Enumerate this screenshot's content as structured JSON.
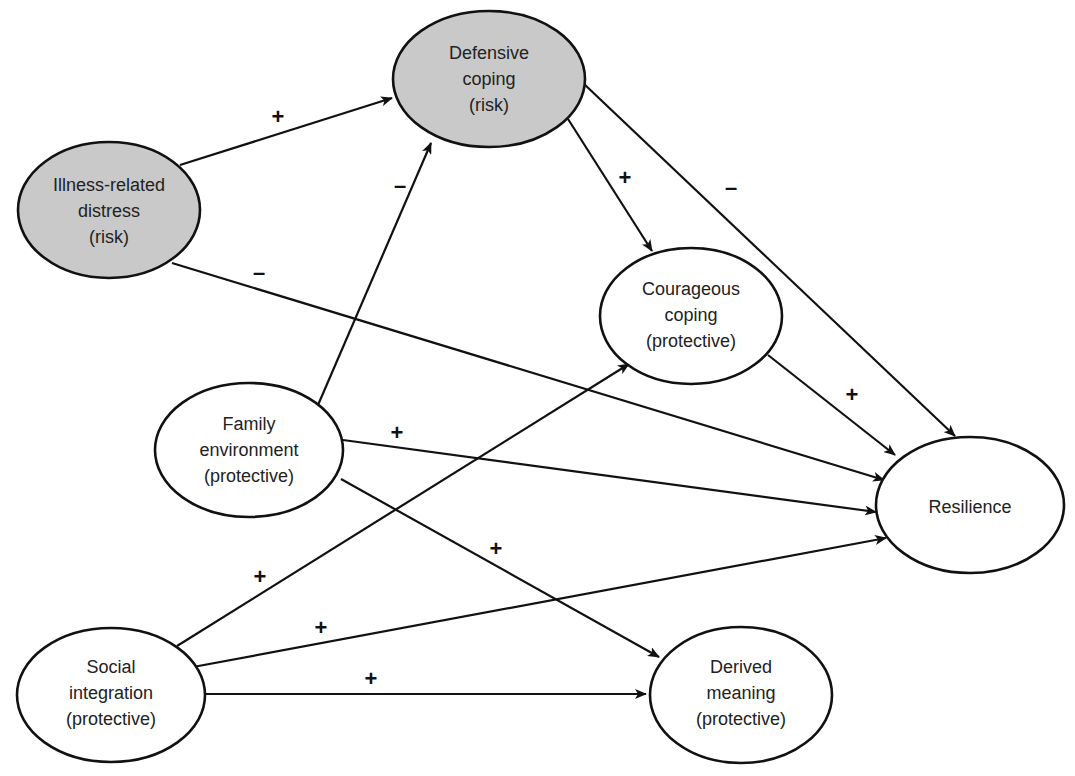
{
  "diagram": {
    "type": "path-model",
    "nodes": [
      {
        "id": "illness",
        "lines": [
          "Illness-related",
          "distress",
          "(risk)"
        ],
        "category": "risk",
        "cx": 109,
        "cy": 210,
        "rx": 91,
        "ry": 68
      },
      {
        "id": "defensive",
        "lines": [
          "Defensive",
          "coping",
          "(risk)"
        ],
        "category": "risk",
        "cx": 489,
        "cy": 79,
        "rx": 96,
        "ry": 68
      },
      {
        "id": "courageous",
        "lines": [
          "Courageous",
          "coping",
          "(protective)"
        ],
        "category": "protective",
        "cx": 691,
        "cy": 316,
        "rx": 91,
        "ry": 68
      },
      {
        "id": "family",
        "lines": [
          "Family",
          "environment",
          "(protective)"
        ],
        "category": "protective",
        "cx": 249,
        "cy": 450,
        "rx": 94,
        "ry": 67
      },
      {
        "id": "resilience",
        "lines": [
          "Resilience"
        ],
        "category": "outcome",
        "cx": 970,
        "cy": 505,
        "rx": 94,
        "ry": 68
      },
      {
        "id": "social",
        "lines": [
          "Social",
          "integration",
          "(protective)"
        ],
        "category": "protective",
        "cx": 111,
        "cy": 695,
        "rx": 94,
        "ry": 67
      },
      {
        "id": "derived",
        "lines": [
          "Derived",
          "meaning",
          "(protective)"
        ],
        "category": "protective",
        "cx": 741,
        "cy": 695,
        "rx": 91,
        "ry": 68
      }
    ],
    "edges": [
      {
        "from": "illness",
        "to": "defensive",
        "sign": "+",
        "x1": 180,
        "y1": 165,
        "x2": 392,
        "y2": 98,
        "lx": 278,
        "ly": 124
      },
      {
        "from": "illness",
        "to": "resilience",
        "sign": "–",
        "x1": 172,
        "y1": 263,
        "x2": 884,
        "y2": 480,
        "lx": 259,
        "ly": 280
      },
      {
        "from": "family",
        "to": "defensive",
        "sign": "–",
        "x1": 315,
        "y1": 412,
        "x2": 431,
        "y2": 143,
        "lx": 400,
        "ly": 193
      },
      {
        "from": "defensive",
        "to": "courageous",
        "sign": "+",
        "x1": 568,
        "y1": 119,
        "x2": 652,
        "y2": 251,
        "lx": 625,
        "ly": 180
      },
      {
        "from": "defensive",
        "to": "resilience",
        "sign": "–",
        "x1": 583,
        "y1": 83,
        "x2": 955,
        "y2": 436,
        "lx": 731,
        "ly": 192
      },
      {
        "from": "courageous",
        "to": "resilience",
        "sign": "+",
        "x1": 768,
        "y1": 355,
        "x2": 895,
        "y2": 455,
        "lx": 852,
        "ly": 397
      },
      {
        "from": "family",
        "to": "resilience",
        "sign": "+",
        "x1": 343,
        "y1": 440,
        "x2": 876,
        "y2": 512,
        "lx": 397,
        "ly": 435
      },
      {
        "from": "family",
        "to": "derived",
        "sign": "+",
        "x1": 341,
        "y1": 479,
        "x2": 659,
        "y2": 657,
        "lx": 496,
        "ly": 551
      },
      {
        "from": "social",
        "to": "courageous",
        "sign": "+",
        "x1": 177,
        "y1": 646,
        "x2": 629,
        "y2": 364,
        "lx": 260,
        "ly": 579
      },
      {
        "from": "social",
        "to": "resilience",
        "sign": "+",
        "x1": 193,
        "y1": 667,
        "x2": 886,
        "y2": 538,
        "lx": 321,
        "ly": 629
      },
      {
        "from": "social",
        "to": "derived",
        "sign": "+",
        "x1": 205,
        "y1": 694,
        "x2": 646,
        "y2": 694,
        "lx": 371,
        "ly": 681
      }
    ],
    "legend_categories": {
      "risk": "risk",
      "protective": "protective"
    }
  },
  "labels": {
    "illness": {
      "l1": "Illness-related",
      "l2": "distress",
      "l3": "(risk)"
    },
    "defensive": {
      "l1": "Defensive",
      "l2": "coping",
      "l3": "(risk)"
    },
    "courageous": {
      "l1": "Courageous",
      "l2": "coping",
      "l3": "(protective)"
    },
    "family": {
      "l1": "Family",
      "l2": "environment",
      "l3": "(protective)"
    },
    "resilience": {
      "l1": "Resilience"
    },
    "social": {
      "l1": "Social",
      "l2": "integration",
      "l3": "(protective)"
    },
    "derived": {
      "l1": "Derived",
      "l2": "meaning",
      "l3": "(protective)"
    }
  },
  "signs": {
    "illness_defensive": "+",
    "illness_resilience": "–",
    "family_defensive": "–",
    "defensive_courageous": "+",
    "defensive_resilience": "–",
    "courageous_resilience": "+",
    "family_resilience": "+",
    "family_derived": "+",
    "social_courageous": "+",
    "social_resilience": "+",
    "social_derived": "+"
  },
  "colors": {
    "risk_fill": "#c9c9c9",
    "protective_fill": "#ffffff",
    "stroke": "#111111",
    "text": "#222222"
  }
}
